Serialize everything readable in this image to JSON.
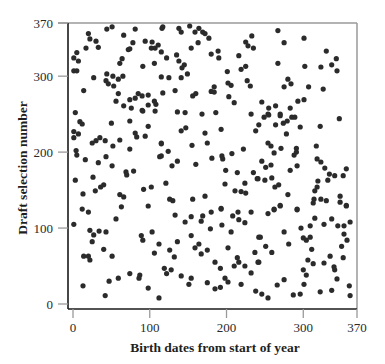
{
  "chart_data": {
    "type": "scatter",
    "title": "",
    "xlabel": "Birth dates from start of year",
    "ylabel": "Draft selection number",
    "xlim": [
      0,
      370
    ],
    "ylim": [
      0,
      370
    ],
    "xticks": [
      0,
      100,
      200,
      300,
      370
    ],
    "yticks": [
      0,
      100,
      200,
      300,
      370
    ],
    "grid": false,
    "legend": null,
    "marker_color": "#2b2b2b",
    "points": [
      [
        5,
        331
      ],
      [
        1,
        324
      ],
      [
        7,
        320
      ],
      [
        1,
        307
      ],
      [
        5,
        307
      ],
      [
        17,
        337
      ],
      [
        20,
        356
      ],
      [
        22,
        349
      ],
      [
        30,
        346
      ],
      [
        33,
        338
      ],
      [
        44,
        362
      ],
      [
        51,
        365
      ],
      [
        66,
        354
      ],
      [
        81,
        362
      ],
      [
        78,
        344
      ],
      [
        72,
        335
      ],
      [
        74,
        336
      ],
      [
        64,
        323
      ],
      [
        61,
        317
      ],
      [
        27,
        298
      ],
      [
        44,
        303
      ],
      [
        52,
        300
      ],
      [
        59,
        296
      ],
      [
        65,
        300
      ],
      [
        43,
        294
      ],
      [
        46,
        290
      ],
      [
        53,
        287
      ],
      [
        59,
        277
      ],
      [
        14,
        281
      ],
      [
        56,
        267
      ],
      [
        66,
        261
      ],
      [
        74,
        269
      ],
      [
        81,
        271
      ],
      [
        85,
        277
      ],
      [
        90,
        274
      ],
      [
        76,
        258
      ],
      [
        91,
        254
      ],
      [
        98,
        275
      ],
      [
        106,
        267
      ],
      [
        98,
        262
      ],
      [
        108,
        263
      ],
      [
        107,
        254
      ],
      [
        3,
        252
      ],
      [
        94,
        346
      ],
      [
        103,
        345
      ],
      [
        107,
        337
      ],
      [
        102,
        337
      ],
      [
        111,
        341
      ],
      [
        116,
        363
      ],
      [
        91,
        313
      ],
      [
        106,
        317
      ],
      [
        115,
        332
      ],
      [
        115,
        299
      ],
      [
        117,
        278
      ],
      [
        117,
        365
      ],
      [
        138,
        363
      ],
      [
        141,
        358
      ],
      [
        152,
        366
      ],
      [
        159,
        358
      ],
      [
        164,
        363
      ],
      [
        169,
        358
      ],
      [
        172,
        356
      ],
      [
        177,
        350
      ],
      [
        163,
        344
      ],
      [
        154,
        337
      ],
      [
        122,
        324
      ],
      [
        135,
        328
      ],
      [
        138,
        320
      ],
      [
        145,
        315
      ],
      [
        142,
        311
      ],
      [
        149,
        303
      ],
      [
        141,
        298
      ],
      [
        125,
        298
      ],
      [
        180,
        329
      ],
      [
        189,
        333
      ],
      [
        190,
        324
      ],
      [
        216,
        327
      ],
      [
        219,
        309
      ],
      [
        225,
        313
      ],
      [
        225,
        345
      ],
      [
        228,
        340
      ],
      [
        233,
        353
      ],
      [
        235,
        337
      ],
      [
        201,
        306
      ],
      [
        202,
        291
      ],
      [
        206,
        288
      ],
      [
        227,
        294
      ],
      [
        231,
        287
      ],
      [
        184,
        286
      ],
      [
        180,
        280
      ],
      [
        184,
        279
      ],
      [
        133,
        281
      ],
      [
        156,
        274
      ],
      [
        160,
        277
      ],
      [
        203,
        273
      ],
      [
        210,
        265
      ],
      [
        136,
        253
      ],
      [
        146,
        252
      ],
      [
        168,
        250
      ],
      [
        186,
        252
      ],
      [
        232,
        250
      ],
      [
        267,
        360
      ],
      [
        275,
        344
      ],
      [
        301,
        350
      ],
      [
        330,
        333
      ],
      [
        343,
        323
      ],
      [
        337,
        315
      ],
      [
        344,
        307
      ],
      [
        323,
        312
      ],
      [
        302,
        313
      ],
      [
        267,
        317
      ],
      [
        280,
        296
      ],
      [
        284,
        290
      ],
      [
        275,
        286
      ],
      [
        307,
        286
      ],
      [
        326,
        283
      ],
      [
        246,
        266
      ],
      [
        255,
        258
      ],
      [
        264,
        261
      ],
      [
        283,
        258
      ],
      [
        293,
        267
      ],
      [
        301,
        269
      ],
      [
        254,
        250
      ],
      [
        270,
        250
      ],
      [
        1,
        227
      ],
      [
        7,
        224
      ],
      [
        1,
        219
      ],
      [
        9,
        240
      ],
      [
        12,
        237
      ],
      [
        25,
        212
      ],
      [
        30,
        215
      ],
      [
        35,
        219
      ],
      [
        42,
        215
      ],
      [
        50,
        238
      ],
      [
        74,
        241
      ],
      [
        98,
        234
      ],
      [
        81,
        225
      ],
      [
        83,
        220
      ],
      [
        94,
        221
      ],
      [
        61,
        216
      ],
      [
        52,
        208
      ],
      [
        74,
        204
      ],
      [
        115,
        211
      ],
      [
        113,
        194
      ],
      [
        4,
        202
      ],
      [
        5,
        196
      ],
      [
        16,
        190
      ],
      [
        33,
        186
      ],
      [
        43,
        194
      ],
      [
        51,
        182
      ],
      [
        69,
        174
      ],
      [
        70,
        170
      ],
      [
        79,
        175
      ],
      [
        26,
        167
      ],
      [
        3,
        163
      ],
      [
        36,
        154
      ],
      [
        40,
        157
      ],
      [
        29,
        149
      ],
      [
        13,
        145
      ],
      [
        61,
        144
      ],
      [
        66,
        141
      ],
      [
        92,
        151
      ],
      [
        102,
        154
      ],
      [
        98,
        129
      ],
      [
        63,
        128
      ],
      [
        12,
        125
      ],
      [
        90,
        255
      ],
      [
        242,
        236
      ],
      [
        238,
        228
      ],
      [
        141,
        228
      ],
      [
        147,
        232
      ],
      [
        172,
        225
      ],
      [
        193,
        230
      ],
      [
        115,
        212
      ],
      [
        124,
        201
      ],
      [
        115,
        195
      ],
      [
        155,
        209
      ],
      [
        175,
        212
      ],
      [
        181,
        192
      ],
      [
        194,
        195
      ],
      [
        195,
        191
      ],
      [
        207,
        198
      ],
      [
        222,
        204
      ],
      [
        136,
        188
      ],
      [
        129,
        182
      ],
      [
        160,
        184
      ],
      [
        199,
        176
      ],
      [
        214,
        173
      ],
      [
        235,
        173
      ],
      [
        240,
        165
      ],
      [
        121,
        159
      ],
      [
        198,
        158
      ],
      [
        224,
        159
      ],
      [
        211,
        149
      ],
      [
        219,
        148
      ],
      [
        225,
        146
      ],
      [
        172,
        142
      ],
      [
        126,
        138
      ],
      [
        130,
        136
      ],
      [
        156,
        138
      ],
      [
        193,
        126
      ],
      [
        249,
        246
      ],
      [
        255,
        249
      ],
      [
        270,
        248
      ],
      [
        264,
        236
      ],
      [
        274,
        238
      ],
      [
        279,
        241
      ],
      [
        285,
        246
      ],
      [
        289,
        246
      ],
      [
        296,
        233
      ],
      [
        278,
        224
      ],
      [
        322,
        234
      ],
      [
        347,
        244
      ],
      [
        254,
        212
      ],
      [
        258,
        208
      ],
      [
        262,
        199
      ],
      [
        271,
        205
      ],
      [
        291,
        205
      ],
      [
        291,
        200
      ],
      [
        288,
        196
      ],
      [
        317,
        208
      ],
      [
        246,
        188
      ],
      [
        251,
        180
      ],
      [
        258,
        183
      ],
      [
        283,
        176
      ],
      [
        292,
        182
      ],
      [
        318,
        191
      ],
      [
        323,
        187
      ],
      [
        328,
        179
      ],
      [
        334,
        171
      ],
      [
        341,
        169
      ],
      [
        332,
        163
      ],
      [
        352,
        169
      ],
      [
        356,
        178
      ],
      [
        241,
        165
      ],
      [
        250,
        163
      ],
      [
        259,
        166
      ],
      [
        263,
        154
      ],
      [
        268,
        157
      ],
      [
        319,
        162
      ],
      [
        318,
        154
      ],
      [
        315,
        149
      ],
      [
        280,
        144
      ],
      [
        314,
        138
      ],
      [
        323,
        138
      ],
      [
        330,
        136
      ],
      [
        348,
        142
      ],
      [
        348,
        134
      ],
      [
        356,
        130
      ],
      [
        313,
        133
      ],
      [
        270,
        130
      ],
      [
        262,
        125
      ],
      [
        292,
        125
      ],
      [
        20,
        121
      ],
      [
        1,
        105
      ],
      [
        22,
        97
      ],
      [
        27,
        91
      ],
      [
        34,
        96
      ],
      [
        43,
        95
      ],
      [
        25,
        82
      ],
      [
        89,
        90
      ],
      [
        91,
        84
      ],
      [
        103,
        95
      ],
      [
        112,
        79
      ],
      [
        40,
        72
      ],
      [
        106,
        67
      ],
      [
        14,
        63
      ],
      [
        20,
        63
      ],
      [
        22,
        58
      ],
      [
        51,
        63
      ],
      [
        119,
        47
      ],
      [
        74,
        40
      ],
      [
        87,
        38
      ],
      [
        86,
        34
      ],
      [
        59,
        34
      ],
      [
        47,
        30
      ],
      [
        13,
        24
      ],
      [
        98,
        21
      ],
      [
        42,
        11
      ],
      [
        112,
        8
      ],
      [
        56,
        112
      ],
      [
        133,
        117
      ],
      [
        146,
        108
      ],
      [
        154,
        115
      ],
      [
        167,
        109
      ],
      [
        169,
        116
      ],
      [
        180,
        121
      ],
      [
        193,
        125
      ],
      [
        179,
        99
      ],
      [
        194,
        104
      ],
      [
        208,
        116
      ],
      [
        215,
        121
      ],
      [
        216,
        111
      ],
      [
        224,
        107
      ],
      [
        232,
        121
      ],
      [
        206,
        95
      ],
      [
        242,
        88
      ],
      [
        154,
        90
      ],
      [
        136,
        82
      ],
      [
        126,
        71
      ],
      [
        132,
        62
      ],
      [
        164,
        79
      ],
      [
        159,
        74
      ],
      [
        175,
        71
      ],
      [
        167,
        66
      ],
      [
        202,
        74
      ],
      [
        237,
        68
      ],
      [
        214,
        61
      ],
      [
        216,
        55
      ],
      [
        185,
        55
      ],
      [
        192,
        47
      ],
      [
        210,
        50
      ],
      [
        224,
        50
      ],
      [
        241,
        55
      ],
      [
        122,
        40
      ],
      [
        128,
        45
      ],
      [
        141,
        37
      ],
      [
        154,
        34
      ],
      [
        151,
        26
      ],
      [
        175,
        28
      ],
      [
        198,
        34
      ],
      [
        202,
        29
      ],
      [
        219,
        26
      ],
      [
        232,
        41
      ],
      [
        185,
        20
      ],
      [
        192,
        22
      ],
      [
        238,
        17
      ],
      [
        254,
        119
      ],
      [
        262,
        124
      ],
      [
        270,
        129
      ],
      [
        292,
        124
      ],
      [
        356,
        129
      ],
      [
        315,
        113
      ],
      [
        337,
        112
      ],
      [
        361,
        108
      ],
      [
        327,
        105
      ],
      [
        345,
        103
      ],
      [
        353,
        103
      ],
      [
        309,
        103
      ],
      [
        297,
        100
      ],
      [
        275,
        95
      ],
      [
        244,
        88
      ],
      [
        300,
        87
      ],
      [
        309,
        88
      ],
      [
        304,
        84
      ],
      [
        353,
        92
      ],
      [
        357,
        84
      ],
      [
        281,
        79
      ],
      [
        251,
        76
      ],
      [
        350,
        76
      ],
      [
        259,
        68
      ],
      [
        311,
        72
      ],
      [
        335,
        63
      ],
      [
        352,
        61
      ],
      [
        306,
        58
      ],
      [
        313,
        53
      ],
      [
        327,
        54
      ],
      [
        242,
        55
      ],
      [
        340,
        49
      ],
      [
        341,
        45
      ],
      [
        300,
        45
      ],
      [
        304,
        38
      ],
      [
        344,
        33
      ],
      [
        275,
        32
      ],
      [
        266,
        25
      ],
      [
        301,
        26
      ],
      [
        360,
        24
      ],
      [
        246,
        13
      ],
      [
        254,
        8
      ],
      [
        287,
        12
      ],
      [
        296,
        13
      ],
      [
        322,
        16
      ],
      [
        337,
        18
      ],
      [
        361,
        11
      ]
    ]
  },
  "plot": {
    "x_axis_title": "Birth dates from start of year",
    "y_axis_title": "Draft selection number",
    "x_tick_labels": [
      "0",
      "100",
      "200",
      "300",
      "370"
    ],
    "y_tick_labels": [
      "0",
      "100",
      "200",
      "300",
      "370"
    ]
  }
}
